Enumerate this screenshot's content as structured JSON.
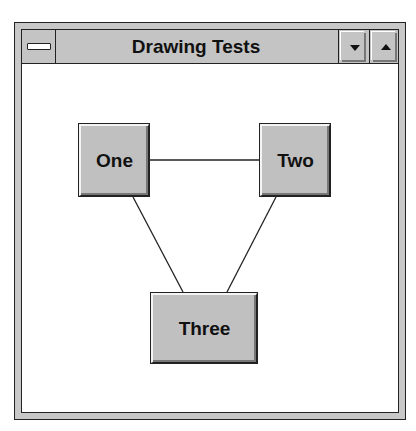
{
  "window": {
    "title": "Drawing Tests",
    "system_menu_icon": "system-menu-icon",
    "minimize_icon": "triangle-down-icon",
    "maximize_icon": "triangle-up-icon"
  },
  "canvas": {
    "nodes": [
      {
        "id": "one",
        "label": "One"
      },
      {
        "id": "two",
        "label": "Two"
      },
      {
        "id": "three",
        "label": "Three"
      }
    ],
    "edges": [
      {
        "from": "One",
        "to": "Two"
      },
      {
        "from": "One",
        "to": "Three"
      },
      {
        "from": "Two",
        "to": "Three"
      }
    ]
  }
}
